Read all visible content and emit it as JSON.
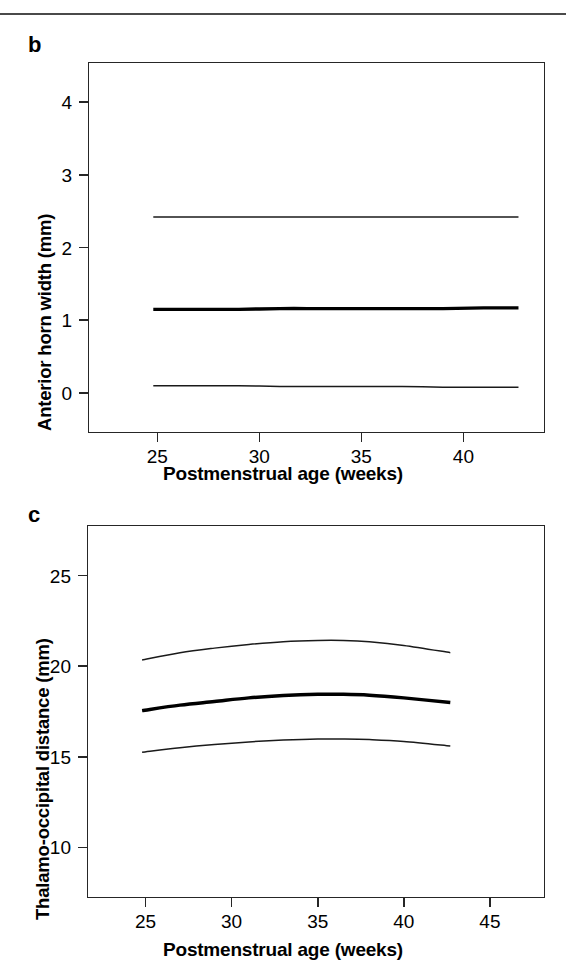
{
  "figure": {
    "panels": [
      {
        "letter": "b",
        "ylabel": "Anterior horn width (mm)",
        "xlabel": "Postmenstrual age (weeks)"
      },
      {
        "letter": "c",
        "ylabel": "Thalamo-occipital distance (mm)",
        "xlabel": "Postmenstrual age (weeks)"
      }
    ]
  },
  "chart_data": [
    {
      "type": "line",
      "panel": "b",
      "title": "",
      "xlabel": "Postmenstrual age (weeks)",
      "ylabel": "Anterior horn width (mm)",
      "xlim": [
        21.6,
        44.0
      ],
      "ylim": [
        -0.55,
        4.55
      ],
      "xticks": [
        25,
        30,
        35,
        40
      ],
      "yticks": [
        0,
        1,
        2,
        3,
        4
      ],
      "xtick_labels": [
        "25",
        "30",
        "35",
        "40"
      ],
      "ytick_labels": [
        "0",
        "1",
        "2",
        "3",
        "4"
      ],
      "grid": false,
      "legend": "none",
      "x": [
        24.8,
        27.0,
        29.0,
        31.0,
        33.0,
        35.0,
        37.0,
        39.0,
        41.0,
        42.7
      ],
      "series": [
        {
          "name": "upper centile",
          "style": "thin",
          "values": [
            2.42,
            2.42,
            2.42,
            2.42,
            2.42,
            2.42,
            2.42,
            2.42,
            2.42,
            2.42
          ]
        },
        {
          "name": "median",
          "style": "bold",
          "values": [
            1.15,
            1.15,
            1.15,
            1.16,
            1.16,
            1.16,
            1.16,
            1.16,
            1.17,
            1.17
          ]
        },
        {
          "name": "lower centile",
          "style": "thin",
          "values": [
            0.1,
            0.1,
            0.1,
            0.09,
            0.09,
            0.09,
            0.09,
            0.08,
            0.08,
            0.08
          ]
        }
      ]
    },
    {
      "type": "line",
      "panel": "c",
      "title": "",
      "xlabel": "Postmenstrual age (weeks)",
      "ylabel": "Thalamo-occipital distance (mm)",
      "xlim": [
        21.6,
        48.2
      ],
      "ylim": [
        7.2,
        27.8
      ],
      "xticks": [
        25,
        30,
        35,
        40,
        45
      ],
      "yticks": [
        10,
        15,
        20,
        25
      ],
      "xtick_labels": [
        "25",
        "30",
        "35",
        "40",
        "45"
      ],
      "ytick_labels": [
        "10",
        "15",
        "20",
        "25"
      ],
      "grid": false,
      "legend": "none",
      "x": [
        24.8,
        27.0,
        29.0,
        31.0,
        33.0,
        35.0,
        36.5,
        38.0,
        40.0,
        42.7
      ],
      "series": [
        {
          "name": "upper centile",
          "style": "thin",
          "values": [
            20.35,
            20.75,
            21.0,
            21.2,
            21.35,
            21.42,
            21.42,
            21.35,
            21.15,
            20.75
          ]
        },
        {
          "name": "median",
          "style": "bold",
          "values": [
            17.55,
            17.85,
            18.05,
            18.25,
            18.38,
            18.45,
            18.45,
            18.4,
            18.25,
            18.0
          ]
        },
        {
          "name": "lower centile",
          "style": "thin",
          "values": [
            15.25,
            15.5,
            15.68,
            15.82,
            15.92,
            15.98,
            15.98,
            15.95,
            15.85,
            15.6
          ]
        }
      ]
    }
  ]
}
